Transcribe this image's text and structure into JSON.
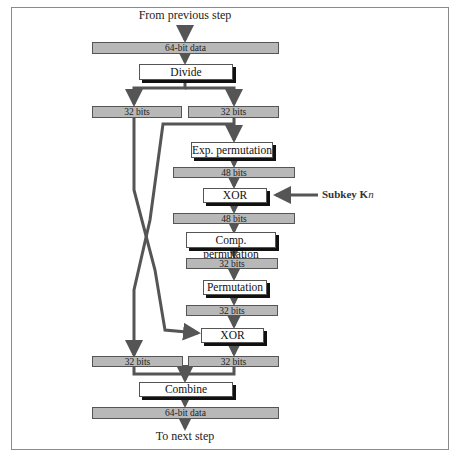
{
  "diagram": {
    "top_label": "From previous step",
    "bottom_label": "To next step",
    "input_block": "64-bit data",
    "divide": "Divide",
    "left_half_in": "32 bits",
    "right_half_in": "32 bits",
    "exp_permutation": "Exp. permutation",
    "bits48_a": "48 bits",
    "xor1": "XOR",
    "subkey_prefix": "Subkey K",
    "subkey_sub": "n",
    "bits48_b": "48 bits",
    "comp_permutation": "Comp. permutation",
    "bits32_a": "32 bits",
    "permutation": "Permutation",
    "bits32_b": "32 bits",
    "xor2": "XOR",
    "left_half_out": "32 bits",
    "right_half_out": "32 bits",
    "combine": "Combine",
    "output_block": "64-bit data"
  },
  "colors": {
    "block_fill": "#b8b8b8",
    "line": "#555555",
    "frame": "#8a8a8a"
  }
}
